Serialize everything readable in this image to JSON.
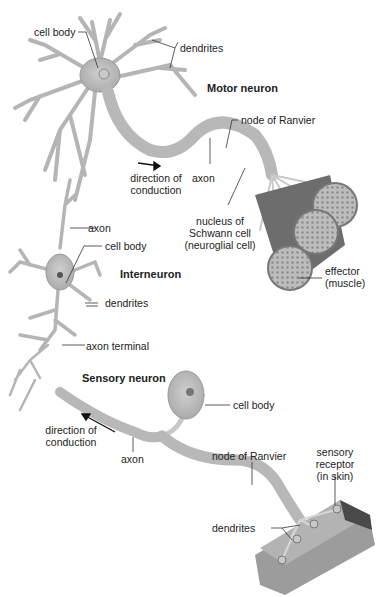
{
  "figure": {
    "type": "anatomical-illustration"
  },
  "neurons": {
    "motor": {
      "title": "Motor neuron",
      "labels": {
        "cell_body": "cell body",
        "dendrites": "dendrites",
        "node_of_ranvier": "node of Ranvier",
        "axon": "axon",
        "direction_line1": "direction of",
        "direction_line2": "conduction",
        "nucleus_line1": "nucleus of",
        "nucleus_line2": "Schwann cell",
        "nucleus_line3": "(neuroglial cell)",
        "effector_line1": "effector",
        "effector_line2": "(muscle)"
      }
    },
    "interneuron": {
      "title": "Interneuron",
      "labels": {
        "axon": "axon",
        "cell_body": "cell body",
        "dendrites": "dendrites",
        "axon_terminal": "axon terminal"
      }
    },
    "sensory": {
      "title": "Sensory neuron",
      "labels": {
        "cell_body": "cell body",
        "direction_line1": "direction of",
        "direction_line2": "conduction",
        "axon": "axon",
        "node_of_ranvier": "node of Ranvier",
        "receptor_line1": "sensory",
        "receptor_line2": "receptor",
        "receptor_line3": "(in skin)",
        "dendrites": "dendrites"
      }
    }
  },
  "colors": {
    "neuron_fill": "#dcdcdc",
    "neuron_stroke": "#9a9a9a",
    "muscle": "#8a8a8a",
    "skin_dark": "#5a5a5a",
    "text": "#222222"
  }
}
